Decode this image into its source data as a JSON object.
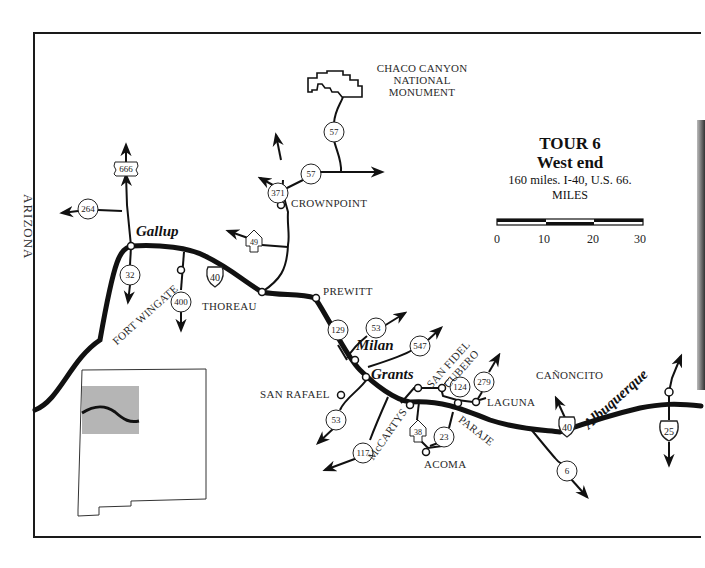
{
  "title": {
    "tour": "TOUR 6",
    "subtitle": "West end",
    "description": "160 miles. I-40, U.S. 66.",
    "scale_label": "MILES",
    "scale_ticks": [
      "0",
      "10",
      "20",
      "30"
    ]
  },
  "state_border_label": "ARIZONA",
  "landmarks": {
    "chaco_line1": "CHACO CANYON",
    "chaco_line2": "NATIONAL",
    "chaco_line3": "MONUMENT"
  },
  "cities": {
    "gallup": "Gallup",
    "milan": "Milan",
    "grants": "Grants",
    "albuquerque": "Albuquerque"
  },
  "places": {
    "crownpoint": "CROWNPOINT",
    "thoreau": "THOREAU",
    "prewitt": "PREWITT",
    "fort_wingate": "FORT WINGATE",
    "san_rafael": "SAN RAFAEL",
    "mccartys": "McCARTYS",
    "san_fidel": "SAN FIDEL",
    "cubero": "CUBERO",
    "laguna": "LAGUNA",
    "paraje": "PARAJE",
    "acoma": "ACOMA",
    "canoncito": "CAÑONCITO"
  },
  "routes": {
    "us666": "666",
    "nm264": "264",
    "nm32": "32",
    "nm400": "400",
    "i40_west": "40",
    "nm371": "371",
    "nm57_north": "57",
    "nm57_south": "57",
    "nm49": "49",
    "nm129": "129",
    "nm53_north": "53",
    "nm547": "547",
    "nm53_south": "53",
    "nm117": "117",
    "nm38": "38",
    "nm23": "23",
    "nm124": "124",
    "nm279": "279",
    "i40_east": "40",
    "nm6": "6",
    "i25": "25"
  },
  "colors": {
    "road": "#111111",
    "inset_highlight": "#b5b5b5",
    "text": "#2a2a2a"
  }
}
